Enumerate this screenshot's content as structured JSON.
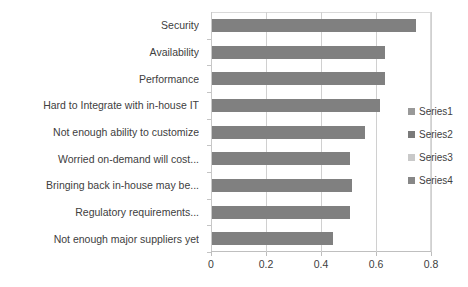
{
  "chart_data": {
    "type": "bar",
    "orientation": "horizontal",
    "title": "",
    "xlabel": "",
    "ylabel": "",
    "xlim": [
      0,
      0.8
    ],
    "xticks": [
      0,
      0.2,
      0.4,
      0.6,
      0.8
    ],
    "xtick_labels": [
      "0",
      "0.2",
      "0.4",
      "0.6",
      "0.8"
    ],
    "grid": true,
    "grid_axis": "x",
    "legend_position": "right",
    "categories": [
      "Security",
      "Availability",
      "Performance",
      "Hard to Integrate with in-house IT",
      "Not enough ability to customize",
      "Worried on-demand will cost...",
      "Bringing back in-house may be...",
      "Regulatory requirements...",
      "Not enough major suppliers yet"
    ],
    "series": [
      {
        "name": "Series1",
        "color": "#808080",
        "values": [
          0.74,
          0.63,
          0.63,
          0.61,
          0.555,
          0.5,
          0.51,
          0.5,
          0.44
        ]
      }
    ],
    "legend_entries": [
      {
        "label": "Series1",
        "color": "#999999"
      },
      {
        "label": "Series2",
        "color": "#7a7a7a"
      },
      {
        "label": "Series3",
        "color": "#c9c9c9"
      },
      {
        "label": "Series4",
        "color": "#878787"
      }
    ],
    "colors": {
      "bar": "#808080",
      "gridline": "#d0d0d0",
      "axis": "#bfbfbf",
      "text": "#404040",
      "background": "#ffffff"
    }
  }
}
